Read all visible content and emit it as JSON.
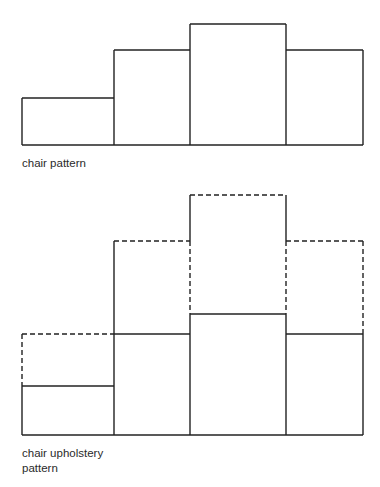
{
  "figures": [
    {
      "name": "chair-pattern",
      "caption": "chair pattern",
      "baseline_y": 145,
      "left_x": 22,
      "solid_bars": [
        {
          "x0": 22,
          "x1": 114,
          "top": 98
        },
        {
          "x0": 114,
          "x1": 190,
          "top": 50
        },
        {
          "x0": 190,
          "x1": 286,
          "top": 24
        },
        {
          "x0": 286,
          "x1": 363,
          "top": 50
        }
      ]
    },
    {
      "name": "chair-upholstery-pattern",
      "caption_line1": "chair upholstery",
      "caption_line2": "pattern",
      "baseline_y": 435,
      "solid_bars": [
        {
          "x0": 22,
          "x1": 114,
          "top": 386
        },
        {
          "x0": 114,
          "x1": 190,
          "top": 334
        },
        {
          "x0": 190,
          "x1": 286,
          "top": 314
        },
        {
          "x0": 286,
          "x1": 363,
          "top": 334
        }
      ],
      "dashed_bars": [
        {
          "x0": 22,
          "x1": 114,
          "top": 334
        },
        {
          "x0": 114,
          "x1": 190,
          "top": 241
        },
        {
          "x0": 190,
          "x1": 286,
          "top": 195
        },
        {
          "x0": 286,
          "x1": 363,
          "top": 241
        }
      ]
    }
  ],
  "colors": {
    "stroke": "#222222",
    "background": "#ffffff"
  }
}
